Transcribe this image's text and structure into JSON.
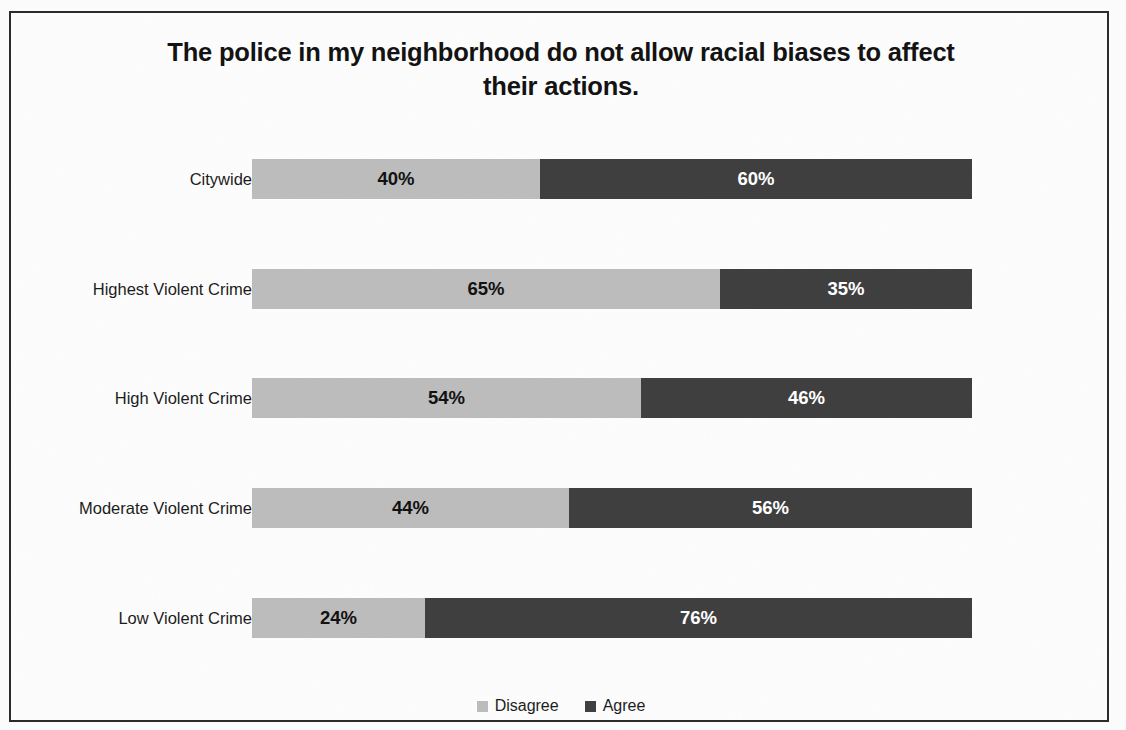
{
  "chart_data": {
    "type": "bar",
    "subtype": "stacked-horizontal-100",
    "title": "The police in my neighborhood do not allow racial biases to affect their actions.",
    "title_line1": "The police in my neighborhood do not allow racial biases to affect",
    "title_line2": "their actions.",
    "xlabel": "",
    "ylabel": "",
    "xlim": [
      0,
      100
    ],
    "grid": false,
    "legend_position": "bottom-center",
    "categories": [
      "Citywide",
      "Highest Violent Crime",
      "High Violent Crime",
      "Moderate Violent Crime",
      "Low Violent Crime"
    ],
    "series": [
      {
        "name": "Disagree",
        "color": "#bcbcbc",
        "label_color": "#121212",
        "values": [
          40,
          65,
          54,
          44,
          24
        ],
        "labels": [
          "40%",
          "65%",
          "54%",
          "44%",
          "24%"
        ]
      },
      {
        "name": "Agree",
        "color": "#3f3f3f",
        "label_color": "#ffffff",
        "values": [
          60,
          35,
          46,
          56,
          76
        ],
        "labels": [
          "60%",
          "35%",
          "46%",
          "56%",
          "76%"
        ]
      }
    ],
    "rows": [
      {
        "category": "Citywide",
        "disagree": 40,
        "agree": 60,
        "disagree_label": "40%",
        "agree_label": "60%"
      },
      {
        "category": "Highest Violent Crime",
        "disagree": 65,
        "agree": 35,
        "disagree_label": "65%",
        "agree_label": "35%"
      },
      {
        "category": "High Violent Crime",
        "disagree": 54,
        "agree": 46,
        "disagree_label": "54%",
        "agree_label": "46%"
      },
      {
        "category": "Moderate Violent Crime",
        "disagree": 44,
        "agree": 56,
        "disagree_label": "44%",
        "agree_label": "56%"
      },
      {
        "category": "Low Violent Crime",
        "disagree": 24,
        "agree": 76,
        "disagree_label": "24%",
        "agree_label": "76%"
      }
    ],
    "legend": [
      {
        "label": "Disagree",
        "color": "#bcbcbc"
      },
      {
        "label": "Agree",
        "color": "#3f3f3f"
      }
    ]
  }
}
